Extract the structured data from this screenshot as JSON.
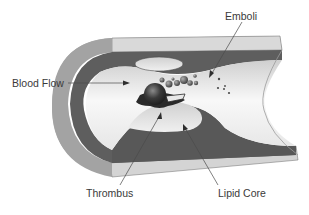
{
  "diagram": {
    "labels": {
      "blood_flow": "Blood Flow",
      "emboli": "Emboli",
      "thrombus": "Thrombus",
      "lipid_core": "Lipid Core"
    },
    "caption": "",
    "colors": {
      "outer_wall": "#a6a6a6",
      "outer_wall_top": "#d9d9d9",
      "inner_wall": "#5e5e5e",
      "lumen": "#f2f2f2",
      "thrombus": "#2e2e2e",
      "lipid_core": "#e2e2e2",
      "label_text": "#3a3a3a",
      "leader_line": "#4a4a4a"
    }
  }
}
